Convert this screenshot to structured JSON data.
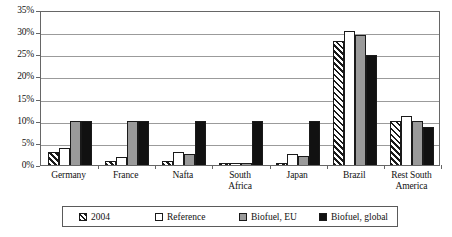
{
  "chart_data": {
    "type": "bar",
    "title": "",
    "xlabel": "",
    "ylabel": "",
    "ylim": [
      0,
      35
    ],
    "ytick_labels": [
      "0%",
      "5%",
      "10%",
      "15%",
      "20%",
      "25%",
      "30%",
      "35%"
    ],
    "ytick_values": [
      0,
      5,
      10,
      15,
      20,
      25,
      30,
      35
    ],
    "grid": true,
    "legend_position": "bottom",
    "categories": [
      "Germany",
      "France",
      "Nafta",
      "South Africa",
      "Japan",
      "Brazil",
      "Rest South America"
    ],
    "category_lines": [
      [
        "Germany"
      ],
      [
        "France"
      ],
      [
        "Nafta"
      ],
      [
        "South",
        "Africa"
      ],
      [
        "Japan"
      ],
      [
        "Brazil"
      ],
      [
        "Rest South",
        "America"
      ]
    ],
    "series": [
      {
        "name": "2004",
        "fill": "diagonal-hatch",
        "color": "#ffffff",
        "values": [
          3.0,
          1.0,
          1.0,
          0.5,
          0.5,
          28.0,
          10.0
        ]
      },
      {
        "name": "Reference",
        "fill": "solid",
        "color": "#ffffff",
        "values": [
          3.8,
          1.8,
          3.0,
          0.5,
          2.5,
          30.2,
          11.0
        ]
      },
      {
        "name": "Biofuel, EU",
        "fill": "solid",
        "color": "#9a9a9a",
        "values": [
          10.0,
          10.0,
          2.5,
          0.4,
          2.0,
          29.3,
          10.0
        ]
      },
      {
        "name": "Biofuel, global",
        "fill": "solid",
        "color": "#111111",
        "values": [
          10.0,
          10.0,
          10.0,
          10.0,
          10.0,
          24.8,
          8.5
        ]
      }
    ]
  },
  "legend": {
    "items": [
      {
        "label": "2004"
      },
      {
        "label": "Reference"
      },
      {
        "label": "Biofuel, EU"
      },
      {
        "label": "Biofuel, global"
      }
    ]
  },
  "colors": {
    "axis": "#666666",
    "gridline": "#9b9b9b",
    "bar_outline": "#1a1a1a",
    "series_eu": "#9a9a9a",
    "series_global": "#111111"
  }
}
